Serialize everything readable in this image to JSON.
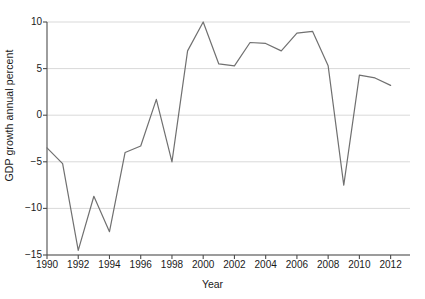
{
  "chart_data": {
    "type": "line",
    "title": "",
    "xlabel": "Year",
    "ylabel": "GDP growth annual percent",
    "x": [
      1990,
      1991,
      1992,
      1993,
      1994,
      1995,
      1996,
      1997,
      1998,
      1999,
      2000,
      2001,
      2002,
      2003,
      2004,
      2005,
      2006,
      2007,
      2008,
      2009,
      2010,
      2011,
      2012
    ],
    "values": [
      -3.5,
      -5.2,
      -14.5,
      -8.7,
      -12.5,
      -4.0,
      -3.3,
      1.7,
      -5.0,
      6.9,
      10.0,
      5.5,
      5.3,
      7.8,
      7.7,
      6.9,
      8.8,
      9.0,
      5.3,
      -7.5,
      4.3,
      4.0,
      3.2
    ],
    "series": [
      {
        "name": "GDP growth annual percent",
        "values": [
          -3.5,
          -5.2,
          -14.5,
          -8.7,
          -12.5,
          -4.0,
          -3.3,
          1.7,
          -5.0,
          6.9,
          10.0,
          5.5,
          5.3,
          7.8,
          7.7,
          6.9,
          8.8,
          9.0,
          5.3,
          -7.5,
          4.3,
          4.0,
          3.2
        ],
        "color": "#707070"
      }
    ],
    "xlim": [
      1990,
      2012.6
    ],
    "ylim": [
      -15,
      10
    ],
    "ytick_labels": [
      "10",
      "5",
      "0",
      "−5",
      "−10",
      "−15"
    ],
    "ytick_values": [
      10,
      5,
      0,
      -5,
      -10,
      -15
    ],
    "xtick_labels": [
      "1990",
      "1992",
      "1994",
      "1996",
      "1998",
      "2000",
      "2002",
      "2004",
      "2006",
      "2008",
      "2010",
      "2012"
    ],
    "xtick_values": [
      1990,
      1992,
      1994,
      1996,
      1998,
      2000,
      2002,
      2004,
      2006,
      2008,
      2010,
      2012
    ],
    "grid": "horizontal",
    "grid_color": "#d9d9d9",
    "axis_color": "#4d4d4d",
    "legend": "none",
    "background": "#ffffff"
  }
}
